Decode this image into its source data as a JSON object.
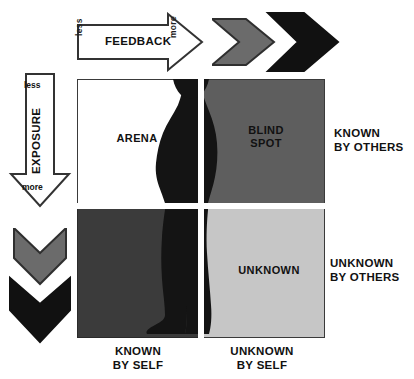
{
  "diagram": {
    "axes": {
      "feedback": {
        "label": "FEEDBACK",
        "less": "less",
        "more": "more",
        "icon": "right-arrow-icon"
      },
      "exposure": {
        "label": "EXPOSURE",
        "less": "less",
        "more": "more",
        "icon": "down-arrow-icon"
      }
    },
    "quadrants": [
      {
        "key": "arena",
        "label": "ARENA",
        "fill": "#ffffff"
      },
      {
        "key": "blind",
        "label": "BLIND\nSPOT",
        "fill": "#5e5e5e"
      },
      {
        "key": "hidden",
        "label": "",
        "fill": "#3b3b3b"
      },
      {
        "key": "unknown",
        "label": "UNKNOWN",
        "fill": "#c6c6c6"
      }
    ],
    "row_labels": {
      "top": "KNOWN\nBY OTHERS",
      "bottom": "UNKNOWN\nBY OTHERS"
    },
    "column_labels": {
      "left": "KNOWN\nBY SELF",
      "right": "UNKNOWN\nBY SELF"
    },
    "chevrons": {
      "gray_fill": "#6b6b6b",
      "black_fill": "#111111",
      "top_icon": "double-chevron-right-icon",
      "left_icon": "double-chevron-down-icon"
    },
    "colors": {
      "outline": "#3a3a3a",
      "text": "#111111",
      "background": "#ffffff",
      "silhouette": "#141414"
    }
  }
}
